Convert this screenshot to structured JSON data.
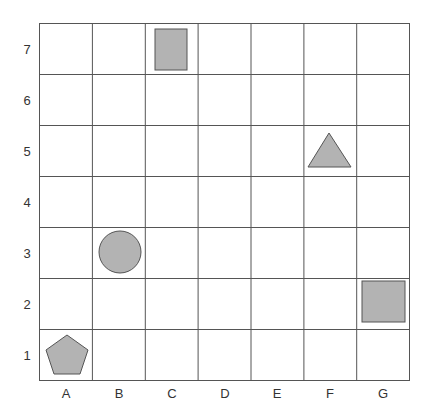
{
  "grid": {
    "columns": [
      "A",
      "B",
      "C",
      "D",
      "E",
      "F",
      "G"
    ],
    "rows": [
      "7",
      "6",
      "5",
      "4",
      "3",
      "2",
      "1"
    ],
    "line_color": "#555555",
    "cell_fill": "#ffffff"
  },
  "shapes": [
    {
      "type": "rectangle",
      "cell": "C7",
      "fill": "#b3b3b3",
      "stroke": "#555555"
    },
    {
      "type": "triangle",
      "cell": "F5",
      "fill": "#b3b3b3",
      "stroke": "#555555"
    },
    {
      "type": "circle",
      "cell": "B3",
      "fill": "#b3b3b3",
      "stroke": "#555555"
    },
    {
      "type": "square",
      "cell": "G2",
      "fill": "#b3b3b3",
      "stroke": "#555555"
    },
    {
      "type": "pentagon",
      "cell": "A1",
      "fill": "#b3b3b3",
      "stroke": "#555555"
    }
  ]
}
